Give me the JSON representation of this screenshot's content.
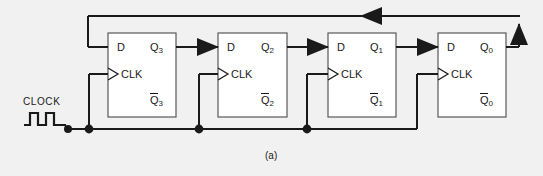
{
  "figure": {
    "caption": "(a)",
    "type": "digital-logic-schematic",
    "colors": {
      "background": "#f1f1f1",
      "wire": "#1a1a1a",
      "box_fill": "#ffffff",
      "box_stroke": "#595959",
      "text": "#1a1a1a"
    }
  },
  "clock": {
    "label": "CLOCK",
    "waveform_pulses": 2
  },
  "flipflops": [
    {
      "id": "ff3",
      "d_label": "D",
      "clk_label": "CLK",
      "q_label": "Q",
      "q_sub": "3",
      "qbar_label": "Q",
      "qbar_sub": "3"
    },
    {
      "id": "ff2",
      "d_label": "D",
      "clk_label": "CLK",
      "q_label": "Q",
      "q_sub": "2",
      "qbar_label": "Q",
      "qbar_sub": "2"
    },
    {
      "id": "ff1",
      "d_label": "D",
      "clk_label": "CLK",
      "q_label": "Q",
      "q_sub": "1",
      "qbar_label": "Q",
      "qbar_sub": "1"
    },
    {
      "id": "ff0",
      "d_label": "D",
      "clk_label": "CLK",
      "q_label": "Q",
      "q_sub": "0",
      "qbar_label": "Q",
      "qbar_sub": "0"
    }
  ],
  "signals": {
    "feedback_direction": "right-to-left",
    "stage_links": [
      "Q3 to D2",
      "Q2 to D1",
      "Q1 to D0"
    ],
    "clock_junction_count": 4
  }
}
